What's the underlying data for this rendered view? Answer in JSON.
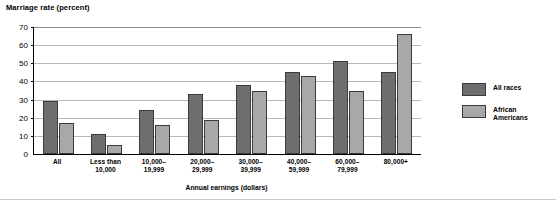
{
  "chart_data": {
    "type": "bar",
    "title": "Marriage rate (percent)",
    "xlabel": "Annual earnings (dollars)",
    "ylabel": "Marriage rate (percent)",
    "ylim": [
      0,
      70
    ],
    "yticks": [
      70,
      60,
      50,
      40,
      30,
      20,
      10,
      0
    ],
    "grid": true,
    "legend_position": "right",
    "categories": [
      "All",
      "Less than\n10,000",
      "10,000–\n19,999",
      "20,000–\n29,999",
      "30,000–\n39,999",
      "40,000–\n59,999",
      "60,000–\n79,999",
      "80,000+"
    ],
    "series": [
      {
        "name": "All races",
        "color": "#6e6e6e",
        "values": [
          29,
          11,
          24,
          33,
          38,
          45,
          51,
          45
        ]
      },
      {
        "name": "African\nAmericans",
        "color": "#a8a8a8",
        "values": [
          17,
          5,
          16,
          19,
          35,
          43,
          35,
          66
        ]
      }
    ]
  },
  "axis": {
    "y_title": "Marriage rate (percent)",
    "x_title": "Annual earnings (dollars)",
    "y_ticks": [
      "70",
      "60",
      "50",
      "40",
      "30",
      "20",
      "10",
      "0"
    ],
    "x_labels": [
      {
        "line1": "All",
        "line2": ""
      },
      {
        "line1": "Less than",
        "line2": "10,000"
      },
      {
        "line1": "10,000–",
        "line2": "19,999"
      },
      {
        "line1": "20,000–",
        "line2": "29,999"
      },
      {
        "line1": "30,000–",
        "line2": "39,999"
      },
      {
        "line1": "40,000–",
        "line2": "59,999"
      },
      {
        "line1": "60,000–",
        "line2": "79,999"
      },
      {
        "line1": "80,000+",
        "line2": ""
      }
    ]
  },
  "legend": {
    "items": [
      {
        "label_line1": "All races",
        "label_line2": "",
        "color": "#6e6e6e"
      },
      {
        "label_line1": "African",
        "label_line2": "Americans",
        "color": "#a8a8a8"
      }
    ]
  },
  "colors": {
    "all_races": "#6e6e6e",
    "african_americans": "#a8a8a8",
    "gridline": "#b9b9b9",
    "axis": "#000000"
  }
}
